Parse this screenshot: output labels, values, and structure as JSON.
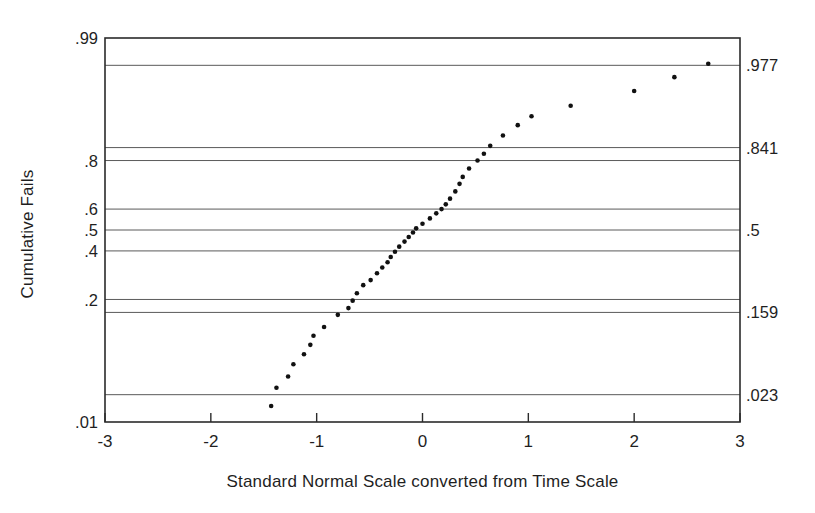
{
  "chart_data": {
    "type": "scatter",
    "title": "",
    "subtitle": "",
    "xlabel": "Standard Normal Scale converted from Time Scale",
    "ylabel": "Cumulative Fails",
    "xlim": [
      -3,
      3
    ],
    "ylim": [
      0.01,
      0.99
    ],
    "y_scale": "probability (normal probit)",
    "grid": true,
    "grid_axis": "y",
    "legend": null,
    "annotations": [],
    "x_ticks": [
      "-3",
      "-2",
      "-1",
      "0",
      "1",
      "2",
      "3"
    ],
    "x_tick_values": [
      -3,
      -2,
      -1,
      0,
      1,
      2,
      3
    ],
    "y_ticks_left": [
      ".99",
      ".8",
      ".6",
      ".5",
      ".4",
      ".2",
      ".01"
    ],
    "y_tick_values_left": [
      0.99,
      0.8,
      0.6,
      0.5,
      0.4,
      0.2,
      0.01
    ],
    "y_ticks_right": [
      ".977",
      ".841",
      ".5",
      ".159",
      ".023"
    ],
    "y_tick_values_right": [
      0.977,
      0.841,
      0.5,
      0.159,
      0.023
    ],
    "gridline_values": [
      0.977,
      0.841,
      0.8,
      0.6,
      0.5,
      0.4,
      0.2,
      0.159,
      0.023
    ],
    "marker": "filled-circle",
    "marker_color": "#111111",
    "marker_size_px": 4.6,
    "points": [
      {
        "x": -1.43,
        "y": 0.0165
      },
      {
        "x": -1.38,
        "y": 0.028
      },
      {
        "x": -1.27,
        "y": 0.038
      },
      {
        "x": -1.22,
        "y": 0.052
      },
      {
        "x": -1.12,
        "y": 0.066
      },
      {
        "x": -1.06,
        "y": 0.082
      },
      {
        "x": -1.03,
        "y": 0.1
      },
      {
        "x": -0.93,
        "y": 0.12
      },
      {
        "x": -0.8,
        "y": 0.152
      },
      {
        "x": -0.7,
        "y": 0.172
      },
      {
        "x": -0.66,
        "y": 0.196
      },
      {
        "x": -0.62,
        "y": 0.222
      },
      {
        "x": -0.56,
        "y": 0.252
      },
      {
        "x": -0.49,
        "y": 0.272
      },
      {
        "x": -0.43,
        "y": 0.3
      },
      {
        "x": -0.38,
        "y": 0.325
      },
      {
        "x": -0.33,
        "y": 0.348
      },
      {
        "x": -0.3,
        "y": 0.372
      },
      {
        "x": -0.26,
        "y": 0.396
      },
      {
        "x": -0.22,
        "y": 0.42
      },
      {
        "x": -0.17,
        "y": 0.444
      },
      {
        "x": -0.13,
        "y": 0.466
      },
      {
        "x": -0.09,
        "y": 0.488
      },
      {
        "x": -0.06,
        "y": 0.508
      },
      {
        "x": 0.0,
        "y": 0.53
      },
      {
        "x": 0.07,
        "y": 0.556
      },
      {
        "x": 0.13,
        "y": 0.58
      },
      {
        "x": 0.18,
        "y": 0.6
      },
      {
        "x": 0.22,
        "y": 0.622
      },
      {
        "x": 0.26,
        "y": 0.648
      },
      {
        "x": 0.31,
        "y": 0.68
      },
      {
        "x": 0.35,
        "y": 0.712
      },
      {
        "x": 0.38,
        "y": 0.74
      },
      {
        "x": 0.44,
        "y": 0.772
      },
      {
        "x": 0.52,
        "y": 0.8
      },
      {
        "x": 0.58,
        "y": 0.822
      },
      {
        "x": 0.64,
        "y": 0.846
      },
      {
        "x": 0.76,
        "y": 0.874
      },
      {
        "x": 0.9,
        "y": 0.898
      },
      {
        "x": 1.03,
        "y": 0.916
      },
      {
        "x": 1.4,
        "y": 0.934
      },
      {
        "x": 2.0,
        "y": 0.954
      },
      {
        "x": 2.38,
        "y": 0.968
      },
      {
        "x": 2.7,
        "y": 0.978
      }
    ]
  },
  "axes": {
    "frame_color": "#2b2b2b",
    "grid_color": "#5a5a5a",
    "background": "#ffffff"
  }
}
